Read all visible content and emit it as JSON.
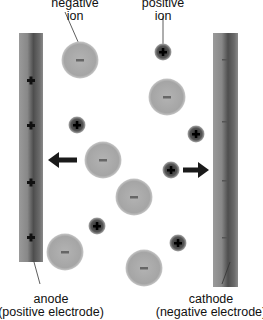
{
  "labels": {
    "negative_ion": [
      "negative",
      "ion"
    ],
    "positive_ion": [
      "positive",
      "ion"
    ],
    "anode": [
      "anode",
      "(positive electrode)"
    ],
    "cathode": [
      "cathode",
      "(negative electrode)"
    ]
  },
  "electrodes": {
    "anode": {
      "x": 19,
      "y": 33,
      "w": 24,
      "h": 229,
      "charges": "+"
    },
    "cathode": {
      "x": 213,
      "y": 33,
      "w": 25,
      "h": 254,
      "charges": "-"
    }
  },
  "negative_ions": [
    {
      "cx": 80,
      "cy": 60
    },
    {
      "cx": 167,
      "cy": 97
    },
    {
      "cx": 103,
      "cy": 160
    },
    {
      "cx": 134,
      "cy": 197
    },
    {
      "cx": 65,
      "cy": 252
    },
    {
      "cx": 144,
      "cy": 268
    }
  ],
  "positive_ions": [
    {
      "cx": 163,
      "cy": 52
    },
    {
      "cx": 77,
      "cy": 125
    },
    {
      "cx": 196,
      "cy": 134
    },
    {
      "cx": 171,
      "cy": 170
    },
    {
      "cx": 97,
      "cy": 226
    },
    {
      "cx": 178,
      "cy": 243
    }
  ],
  "anode_plus_marks": [
    82,
    126,
    183,
    237
  ],
  "colors": {
    "negative_ion": "#a8a8a8",
    "positive_ion": "#444444",
    "electrode": "#7a7a7a",
    "arrow": "#1a1a1a"
  }
}
